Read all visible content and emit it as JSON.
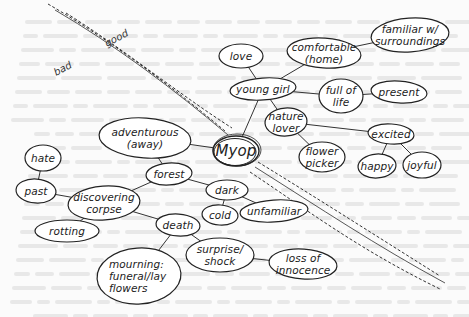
{
  "diagram": {
    "type": "mind-map",
    "center": {
      "id": "myop",
      "label": "Myop",
      "x": 236,
      "y": 151
    },
    "divider": {
      "labels": {
        "good": "good",
        "bad": "bad"
      },
      "description": "dashed road-like diagonal band splitting the map into good (upper right) and bad (lower left) halves"
    },
    "nodes": [
      {
        "id": "young-girl",
        "label": "young girl",
        "x": 263,
        "y": 89,
        "rx": 33,
        "ry": 11
      },
      {
        "id": "love",
        "label": "love",
        "x": 241,
        "y": 56,
        "rx": 22,
        "ry": 12
      },
      {
        "id": "comfortable",
        "label": [
          "comfortable",
          "(home)"
        ],
        "x": 324,
        "y": 53,
        "rx": 37,
        "ry": 15
      },
      {
        "id": "familiar",
        "label": [
          "familiar w/",
          "surroundings"
        ],
        "x": 410,
        "y": 35,
        "rx": 39,
        "ry": 17
      },
      {
        "id": "full-of-life",
        "label": [
          "full of",
          "life"
        ],
        "x": 341,
        "y": 96,
        "rx": 22,
        "ry": 17
      },
      {
        "id": "present",
        "label": "present",
        "x": 399,
        "y": 92,
        "rx": 28,
        "ry": 11
      },
      {
        "id": "nature-lover",
        "label": [
          "nature",
          "lover"
        ],
        "x": 286,
        "y": 122,
        "rx": 21,
        "ry": 14
      },
      {
        "id": "flower-picker",
        "label": [
          "flower",
          "picker"
        ],
        "x": 322,
        "y": 157,
        "rx": 23,
        "ry": 15
      },
      {
        "id": "excited",
        "label": "excited",
        "x": 391,
        "y": 134,
        "rx": 23,
        "ry": 10
      },
      {
        "id": "happy",
        "label": "happy",
        "x": 377,
        "y": 166,
        "rx": 19,
        "ry": 12
      },
      {
        "id": "joyful",
        "label": "joyful",
        "x": 422,
        "y": 165,
        "rx": 19,
        "ry": 13
      },
      {
        "id": "adventurous",
        "label": [
          "adventurous",
          "(away)"
        ],
        "x": 145,
        "y": 138,
        "rx": 46,
        "ry": 20
      },
      {
        "id": "forest",
        "label": "forest",
        "x": 169,
        "y": 174,
        "rx": 23,
        "ry": 11
      },
      {
        "id": "dark",
        "label": "dark",
        "x": 227,
        "y": 190,
        "rx": 21,
        "ry": 10
      },
      {
        "id": "cold",
        "label": "cold",
        "x": 220,
        "y": 215,
        "rx": 18,
        "ry": 10
      },
      {
        "id": "unfamiliar",
        "label": "unfamiliar",
        "x": 274,
        "y": 211,
        "rx": 34,
        "ry": 11
      },
      {
        "id": "hate",
        "label": "hate",
        "x": 43,
        "y": 158,
        "rx": 18,
        "ry": 13
      },
      {
        "id": "past",
        "label": "past",
        "x": 36,
        "y": 191,
        "rx": 20,
        "ry": 12
      },
      {
        "id": "discovering-corpse",
        "label": [
          "discovering",
          "corpse"
        ],
        "x": 104,
        "y": 203,
        "rx": 36,
        "ry": 17
      },
      {
        "id": "rotting",
        "label": "rotting",
        "x": 67,
        "y": 231,
        "rx": 32,
        "ry": 11
      },
      {
        "id": "death",
        "label": "death",
        "x": 178,
        "y": 225,
        "rx": 22,
        "ry": 11
      },
      {
        "id": "mourning",
        "label": [
          "mourning:",
          "funeral/lay",
          "flowers"
        ],
        "x": 139,
        "y": 276,
        "rx": 42,
        "ry": 28
      },
      {
        "id": "surprise-shock",
        "label": [
          "surprise/",
          "shock"
        ],
        "x": 220,
        "y": 255,
        "rx": 34,
        "ry": 17
      },
      {
        "id": "loss-of-innocence",
        "label": [
          "loss of",
          "innocence"
        ],
        "x": 303,
        "y": 264,
        "rx": 34,
        "ry": 15
      }
    ],
    "edges": [
      [
        "myop",
        "young-girl"
      ],
      [
        "young-girl",
        "love"
      ],
      [
        "young-girl",
        "comfortable"
      ],
      [
        "comfortable",
        "familiar"
      ],
      [
        "young-girl",
        "full-of-life"
      ],
      [
        "full-of-life",
        "present"
      ],
      [
        "young-girl",
        "nature-lover"
      ],
      [
        "nature-lover",
        "flower-picker"
      ],
      [
        "nature-lover",
        "excited"
      ],
      [
        "excited",
        "happy"
      ],
      [
        "excited",
        "joyful"
      ],
      [
        "myop",
        "adventurous"
      ],
      [
        "adventurous",
        "forest"
      ],
      [
        "forest",
        "dark"
      ],
      [
        "dark",
        "cold"
      ],
      [
        "dark",
        "unfamiliar"
      ],
      [
        "forest",
        "discovering-corpse"
      ],
      [
        "discovering-corpse",
        "past"
      ],
      [
        "past",
        "hate"
      ],
      [
        "discovering-corpse",
        "rotting"
      ],
      [
        "discovering-corpse",
        "death"
      ],
      [
        "death",
        "mourning"
      ],
      [
        "death",
        "surprise-shock"
      ],
      [
        "surprise-shock",
        "loss-of-innocence"
      ]
    ]
  }
}
